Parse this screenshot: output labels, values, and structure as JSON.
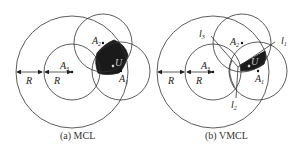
{
  "panels": [
    {
      "id": "a",
      "caption": "(a)  MCL",
      "labels": {
        "A1": "A",
        "A1_sub": "1",
        "A2": "A",
        "A2_sub": "2",
        "A3": "A",
        "A3_sub": "3",
        "U": "U",
        "R1": "R",
        "R2": "R"
      }
    },
    {
      "id": "b",
      "caption": "(b)  VMCL",
      "labels": {
        "A1": "A",
        "A1_sub": "1",
        "A2": "A",
        "A2_sub": "2",
        "A3": "A",
        "A3_sub": "3",
        "U": "U",
        "R1": "R",
        "R2": "R",
        "l1": "l",
        "l1_sub": "1",
        "l2": "l",
        "l2_sub": "2",
        "l3": "l",
        "l3_sub": "3"
      }
    }
  ],
  "colors": {
    "stroke": "#333333",
    "fill": "#1a1a1a"
  }
}
